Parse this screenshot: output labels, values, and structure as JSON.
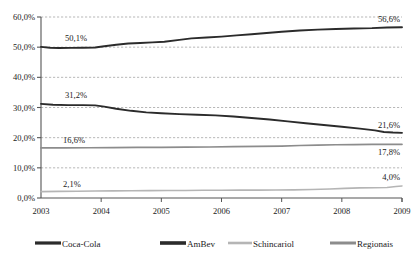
{
  "chart_data": {
    "type": "line",
    "title": "",
    "subtitle": "",
    "xlabel": "",
    "ylabel": "",
    "xlim": [
      2003,
      2009
    ],
    "ylim": [
      0,
      60
    ],
    "grid": true,
    "grid_style": "dashed-horizontal",
    "legend_position": "bottom",
    "x": [
      2003,
      2009
    ],
    "xticklabels": [
      "2003",
      "2004",
      "2005",
      "2006",
      "2007",
      "2008",
      "2009"
    ],
    "yticklabels": [
      "0,0%",
      "10,0%",
      "20,0%",
      "30,0%",
      "40,0%",
      "50,0%",
      "60,0%"
    ],
    "ytickvalues": [
      0,
      10,
      20,
      30,
      40,
      50,
      60
    ],
    "series": [
      {
        "name": "Coca-Cola",
        "color": "#2b2b2b",
        "width": 1.9,
        "start_label": "50,1%",
        "end_label": "56,6%",
        "x": [
          2003.0,
          2003.15,
          2003.3,
          2003.5,
          2003.7,
          2003.9,
          2004.05,
          2004.25,
          2004.45,
          2004.65,
          2004.85,
          2005.05,
          2005.3,
          2005.5,
          2005.75,
          2006.0,
          2006.25,
          2006.5,
          2006.75,
          2007.0,
          2007.3,
          2007.6,
          2007.9,
          2008.2,
          2008.5,
          2008.75,
          2009.0
        ],
        "values": [
          50.1,
          49.8,
          49.7,
          49.75,
          49.8,
          49.9,
          50.3,
          50.8,
          51.2,
          51.4,
          51.6,
          51.8,
          52.4,
          52.9,
          53.2,
          53.5,
          53.9,
          54.3,
          54.7,
          55.1,
          55.5,
          55.8,
          56.0,
          56.2,
          56.3,
          56.5,
          56.6
        ]
      },
      {
        "name": "AmBev",
        "color": "#2b2b2b",
        "width": 1.9,
        "start_label": "31,2%",
        "end_label": "21,6%",
        "x": [
          2003.0,
          2003.2,
          2003.45,
          2003.7,
          2003.9,
          2004.05,
          2004.25,
          2004.5,
          2004.75,
          2005.0,
          2005.3,
          2005.6,
          2005.9,
          2006.2,
          2006.5,
          2006.8,
          2007.1,
          2007.4,
          2007.7,
          2008.0,
          2008.3,
          2008.55,
          2008.7,
          2008.85,
          2009.0
        ],
        "values": [
          31.2,
          30.9,
          30.8,
          30.8,
          30.7,
          30.3,
          29.6,
          28.9,
          28.4,
          28.1,
          27.8,
          27.6,
          27.4,
          27.0,
          26.5,
          26.0,
          25.4,
          24.8,
          24.2,
          23.6,
          23.0,
          22.4,
          21.9,
          21.7,
          21.6
        ]
      },
      {
        "name": "Schincariol",
        "color": "#b5b5b5",
        "width": 1.6,
        "start_label": "2,1%",
        "end_label": "4,0%",
        "x": [
          2003.0,
          2003.3,
          2003.6,
          2003.9,
          2004.2,
          2004.5,
          2004.8,
          2005.1,
          2005.4,
          2005.7,
          2006.0,
          2006.3,
          2006.6,
          2006.9,
          2007.2,
          2007.5,
          2007.8,
          2008.05,
          2008.3,
          2008.55,
          2008.75,
          2008.9,
          2009.0
        ],
        "values": [
          2.1,
          2.2,
          2.25,
          2.3,
          2.35,
          2.4,
          2.45,
          2.5,
          2.5,
          2.55,
          2.55,
          2.6,
          2.6,
          2.65,
          2.7,
          2.8,
          3.0,
          3.2,
          3.35,
          3.4,
          3.5,
          3.8,
          4.0
        ]
      },
      {
        "name": "Regionais",
        "color": "#8c8c8c",
        "width": 1.7,
        "start_label": "16,6%",
        "end_label": "17,8%",
        "x": [
          2003.0,
          2003.4,
          2003.8,
          2004.2,
          2004.6,
          2005.0,
          2005.4,
          2005.8,
          2006.2,
          2006.6,
          2007.0,
          2007.3,
          2007.6,
          2007.9,
          2008.2,
          2008.5,
          2008.75,
          2009.0
        ],
        "values": [
          16.6,
          16.6,
          16.65,
          16.7,
          16.75,
          16.8,
          16.85,
          16.9,
          17.0,
          17.1,
          17.2,
          17.4,
          17.55,
          17.65,
          17.7,
          17.75,
          17.8,
          17.8
        ]
      }
    ]
  },
  "legend": {
    "items": [
      {
        "label": "Coca-Cola",
        "color": "#2b2b2b",
        "width": 3.2
      },
      {
        "label": "AmBev",
        "color": "#2b2b2b",
        "width": 3.6
      },
      {
        "label": "Schincariol",
        "color": "#b5b5b5",
        "width": 2.6
      },
      {
        "label": "Regionais",
        "color": "#8c8c8c",
        "width": 3.0
      }
    ]
  },
  "axis": {
    "line_color": "#555555",
    "grid_color": "#999999"
  }
}
